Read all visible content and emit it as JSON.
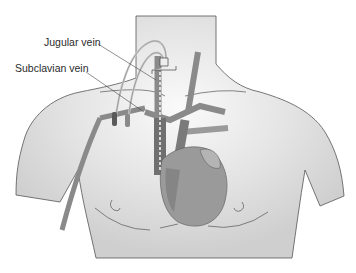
{
  "figure": {
    "labels": {
      "jugular": "Jugular vein",
      "subclavian": "Subclavian vein"
    },
    "colors": {
      "body_fill": "#d9d9d9",
      "body_highlight": "#f4f4f4",
      "outline": "#555555",
      "vessel": "#8a8a8a",
      "vessel_dark": "#707070",
      "heart": "#9a9a9a",
      "heart_light": "#b4b4b4",
      "catheter": "#cfcfcf",
      "catheter_tip": "#5a5a5a"
    }
  }
}
